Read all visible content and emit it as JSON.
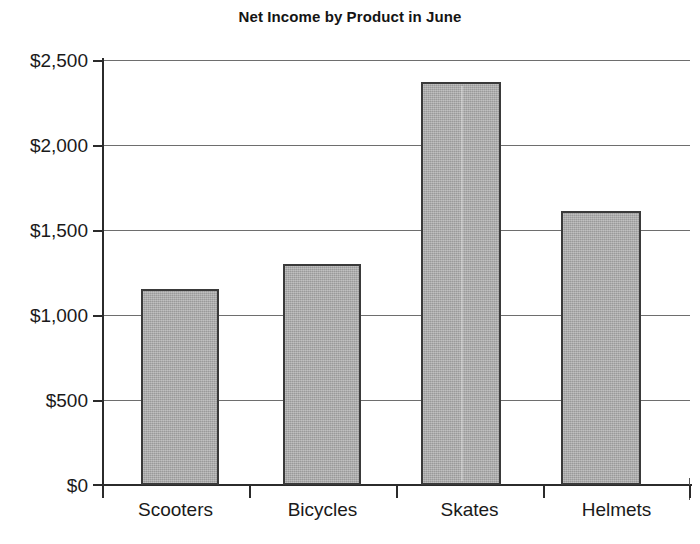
{
  "chart_data": {
    "type": "bar",
    "title": "Net Income by Product in June",
    "xlabel": "",
    "ylabel": "",
    "categories": [
      "Scooters",
      "Bicycles",
      "Skates",
      "Helmets"
    ],
    "values": [
      1150,
      1300,
      2370,
      1610
    ],
    "ylim": [
      0,
      2500
    ],
    "ytick_values": [
      0,
      500,
      1000,
      1500,
      2000,
      2500
    ],
    "ytick_labels": [
      "$0",
      "$500",
      "$1,000",
      "$1,500",
      "$2,000",
      "$2,500"
    ],
    "grid": true,
    "grid_axis": "y",
    "legend": false,
    "bar_fill_color": "#a9a9a9",
    "bar_edge_color": "#3a3a3a",
    "gridline_color": "#6e6e6e",
    "axis_color": "#2b2b2b",
    "background_color": "#ffffff"
  }
}
